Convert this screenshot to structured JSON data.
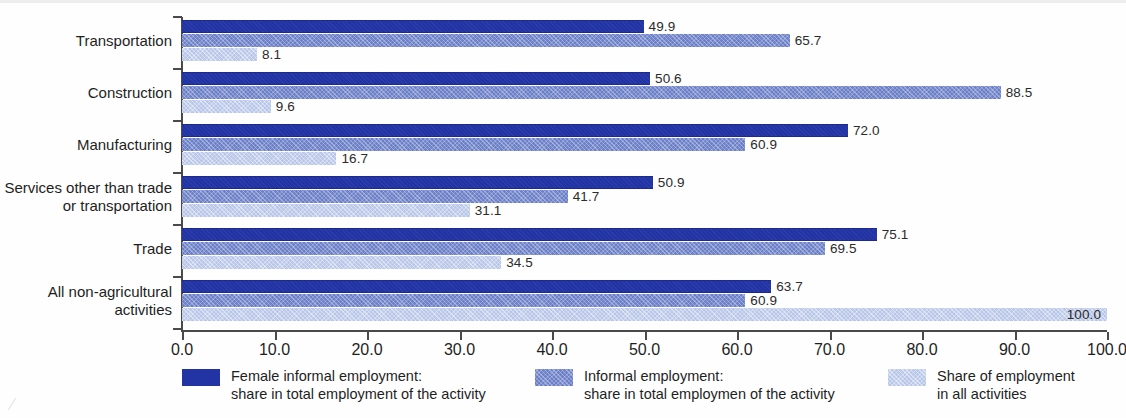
{
  "chart_data": {
    "type": "bar",
    "orientation": "horizontal",
    "title": "",
    "xlabel": "",
    "ylabel": "",
    "xlim": [
      0,
      100
    ],
    "xticks": [
      "0.0",
      "10.0",
      "20.0",
      "30.0",
      "40.0",
      "50.0",
      "60.0",
      "70.0",
      "80.0",
      "90.0",
      "100.0"
    ],
    "grid": false,
    "legend_position": "bottom",
    "categories": [
      "Transportation",
      "Construction",
      "Manufacturing",
      "Services other than trade\nor transportation",
      "Trade",
      "All non-agricultural\nactivities"
    ],
    "series": [
      {
        "name": "Female informal employment:\nshare in total employment of the activity",
        "color": "#2233a4",
        "values": [
          49.9,
          50.6,
          72.0,
          50.9,
          75.1,
          63.7
        ]
      },
      {
        "name": "Informal employment:\nshare in total employmen of the activity",
        "color": "#6c80c8",
        "values": [
          65.7,
          88.5,
          60.9,
          41.7,
          69.5,
          60.9
        ]
      },
      {
        "name": "Share of employment\nin all activities",
        "color": "#b8c6e8",
        "values": [
          8.1,
          9.6,
          16.7,
          31.1,
          34.5,
          100.0
        ]
      }
    ],
    "value_labels": [
      [
        "49.9",
        "65.7",
        "8.1"
      ],
      [
        "50.6",
        "88.5",
        "9.6"
      ],
      [
        "72.0",
        "60.9",
        "16.7"
      ],
      [
        "50.9",
        "41.7",
        "31.1"
      ],
      [
        "75.1",
        "69.5",
        "34.5"
      ],
      [
        "63.7",
        "60.9",
        "100.0"
      ]
    ]
  },
  "legend": {
    "items": [
      {
        "label": "Female informal employment:\nshare in total employment of the activity",
        "swatch": "s0"
      },
      {
        "label": "Informal employment:\nshare in total employmen of the activity",
        "swatch": "s1"
      },
      {
        "label": "Share of employment\nin all activities",
        "swatch": "s2"
      }
    ]
  }
}
